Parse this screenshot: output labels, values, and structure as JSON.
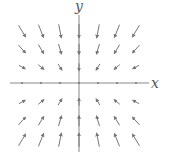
{
  "chart_data": {
    "type": "vector_field",
    "title": "",
    "xlabel": "x",
    "ylabel": "y",
    "grid": false,
    "axes": {
      "origin": [
        79,
        83
      ],
      "x_range_px": [
        10,
        149
      ],
      "y_range_px": [
        15,
        152
      ]
    },
    "grid_points_x": [
      -3,
      -2,
      -1,
      0,
      1,
      2,
      3
    ],
    "grid_points_y": [
      3,
      2,
      1,
      0,
      -1,
      -2,
      -3
    ],
    "field_description": "Vectors point toward the x-axis; zero along the x-axis; magnitude grows with |y|",
    "color": "#777777"
  }
}
